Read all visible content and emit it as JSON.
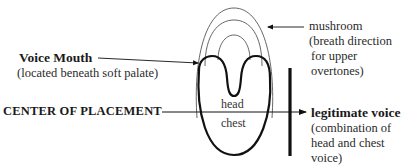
{
  "diagram": {
    "labels": {
      "voice_mouth": {
        "title": "Voice Mouth",
        "note": "(located beneath soft palate)"
      },
      "center_of_placement": "CENTER OF PLACEMENT",
      "mushroom": {
        "title": "mushroom",
        "note_lines": [
          "(breath direction",
          "for upper",
          "overtones)"
        ]
      },
      "legitimate_voice": {
        "title": "legitimate voice",
        "note_lines": [
          "(combination of",
          "head and chest",
          "voice)"
        ]
      },
      "head": "head",
      "chest": "chest"
    },
    "colors": {
      "stroke_bold": "#111111",
      "stroke_thin": "#555555",
      "text": "#1a1a1a"
    }
  }
}
